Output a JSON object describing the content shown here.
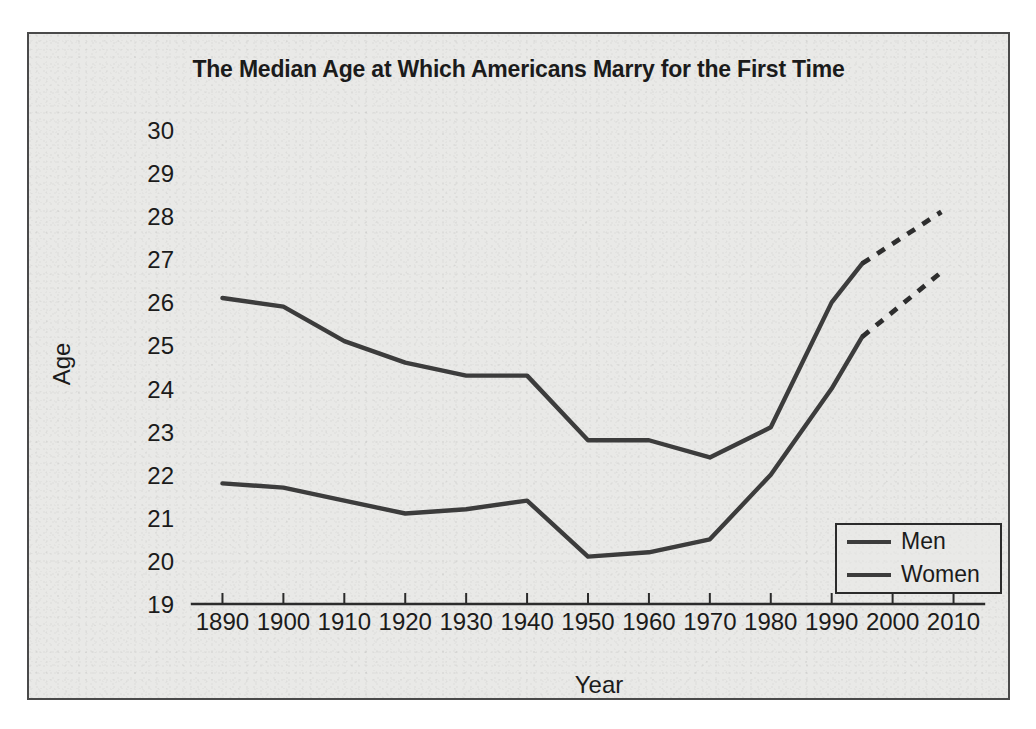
{
  "figure": {
    "background_color": "#e9e9e7",
    "border_color": "#4a4a4a",
    "line_color": "#3c3c3c"
  },
  "chart_data": {
    "type": "line",
    "title": "The Median Age at Which Americans Marry for the First Time",
    "xlabel": "Year",
    "ylabel": "Age",
    "xlim": [
      1885,
      2015
    ],
    "ylim": [
      19,
      30
    ],
    "grid": false,
    "legend_position": "bottom-right",
    "x_tick_labels": [
      "1890",
      "1900",
      "1910",
      "1920",
      "1930",
      "1940",
      "1950",
      "1960",
      "1970",
      "1980",
      "1990",
      "2000",
      "2010"
    ],
    "x_ticks": [
      1890,
      1900,
      1910,
      1920,
      1930,
      1940,
      1950,
      1960,
      1970,
      1980,
      1990,
      2000,
      2010
    ],
    "y_tick_labels": [
      "30",
      "29",
      "28",
      "27",
      "26",
      "25",
      "24",
      "23",
      "22",
      "21",
      "20",
      "19"
    ],
    "y_ticks": [
      30,
      29,
      28,
      27,
      26,
      25,
      24,
      23,
      22,
      21,
      20,
      19
    ],
    "series": [
      {
        "name": "Men",
        "x": [
          1890,
          1900,
          1910,
          1920,
          1930,
          1940,
          1950,
          1960,
          1970,
          1980,
          1990,
          1995
        ],
        "values": [
          26.1,
          25.9,
          25.1,
          24.6,
          24.3,
          24.3,
          22.8,
          22.8,
          22.4,
          23.1,
          26.0,
          26.9
        ],
        "projection_x": [
          1995,
          2008
        ],
        "projection_values": [
          26.9,
          28.1
        ],
        "style": "solid",
        "projection_style": "dashed"
      },
      {
        "name": "Women",
        "x": [
          1890,
          1900,
          1910,
          1920,
          1930,
          1940,
          1950,
          1960,
          1970,
          1980,
          1990,
          1995
        ],
        "values": [
          21.8,
          21.7,
          21.4,
          21.1,
          21.2,
          21.4,
          20.1,
          20.2,
          20.5,
          22.0,
          24.0,
          25.2
        ],
        "projection_x": [
          1995,
          2008
        ],
        "projection_values": [
          25.2,
          26.7
        ],
        "style": "solid",
        "projection_style": "dashed"
      }
    ]
  },
  "legend": {
    "entries": [
      {
        "label": "Men"
      },
      {
        "label": "Women"
      }
    ]
  }
}
